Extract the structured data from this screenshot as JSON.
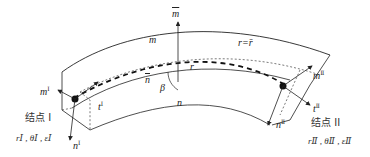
{
  "diagram": {
    "type": "curved-beam-element",
    "labels": {
      "m_bar": "m",
      "m": "m",
      "r_bar": "r=r̄",
      "r": "r",
      "n_bar": "n",
      "beta": "β",
      "n": "n",
      "m1": "m",
      "m1_sup": "Ⅰ",
      "t1": "t",
      "t1_sup": "Ⅰ",
      "n1": "n",
      "n1_sup": "Ⅰ",
      "m2": "m",
      "m2_sup": "Ⅱ",
      "t2": "t",
      "t2_sup": "Ⅱ",
      "n2": "n",
      "n2_sup": "Ⅱ"
    },
    "nodes": [
      {
        "name": "结点 I",
        "vars": "rⅠ , θⅠ , εⅠ"
      },
      {
        "name": "结点 II",
        "vars": "rⅡ , θⅡ , εⅡ"
      }
    ],
    "colors": {
      "stroke": "#222222",
      "node_fill": "#111111"
    }
  }
}
